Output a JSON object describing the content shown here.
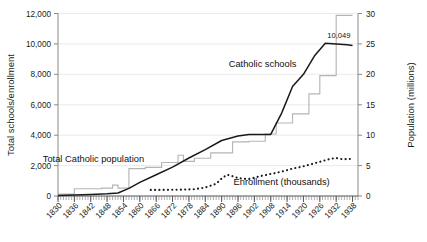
{
  "chart_data": {
    "type": "line",
    "title": "",
    "subtitle": "",
    "xlabel": "",
    "ylabel": "Total schools/enrollment",
    "y2label": "Population (millions)",
    "grid": true,
    "legend_position": "inline-annotations",
    "xlim": [
      1830,
      1940
    ],
    "ylim": [
      0,
      12000
    ],
    "y2lim": [
      0,
      30
    ],
    "x_tick_labels": [
      "1830",
      "1836",
      "1842",
      "1848",
      "1854",
      "1860",
      "1866",
      "1872",
      "1878",
      "1884",
      "1890",
      "1896",
      "1902",
      "1908",
      "1914",
      "1920",
      "1926",
      "1932",
      "1938"
    ],
    "x_tick_values": [
      1830,
      1836,
      1842,
      1848,
      1854,
      1860,
      1866,
      1872,
      1878,
      1884,
      1890,
      1896,
      1902,
      1908,
      1914,
      1920,
      1926,
      1932,
      1938
    ],
    "y_tick_labels": [
      "0",
      "2,000",
      "4,000",
      "6,000",
      "8,000",
      "10,000",
      "12,000"
    ],
    "y_tick_values": [
      0,
      2000,
      4000,
      6000,
      8000,
      10000,
      12000
    ],
    "y2_tick_labels": [
      "0",
      "5",
      "10",
      "15",
      "20",
      "25",
      "30"
    ],
    "y2_tick_values": [
      0,
      5,
      10,
      15,
      20,
      25,
      30
    ],
    "annotations": [
      {
        "name": "catholic-schools-label",
        "text": "Catholic schools",
        "x": 1905,
        "y": 8500,
        "axis": "left"
      },
      {
        "name": "total-catholic-population-label",
        "text": "Total Catholic population",
        "x": 1843,
        "y": 2250,
        "axis": "left"
      },
      {
        "name": "enrollment-label",
        "text": "Enrollment (thousands)",
        "x": 1912,
        "y": 700,
        "axis": "left"
      },
      {
        "name": "schools-endpoint-value-label",
        "text": "10,049",
        "x": 1933,
        "y": 10400,
        "axis": "left"
      }
    ],
    "series": [
      {
        "name": "Catholic schools",
        "axis": "left",
        "style": "solid-line",
        "color": "#1a1a1a",
        "unit": "schools",
        "x": [
          1830,
          1836,
          1842,
          1848,
          1852,
          1856,
          1860,
          1866,
          1872,
          1878,
          1884,
          1890,
          1896,
          1900,
          1904,
          1908,
          1912,
          1916,
          1920,
          1924,
          1928,
          1932,
          1936,
          1938
        ],
        "values": [
          35,
          60,
          100,
          150,
          200,
          500,
          900,
          1400,
          1900,
          2500,
          3050,
          3650,
          3950,
          4050,
          4050,
          4050,
          5450,
          7200,
          8000,
          9200,
          10049,
          10000,
          9950,
          9900
        ]
      },
      {
        "name": "Total Catholic population",
        "axis": "right",
        "style": "step-line",
        "color": "#b0b0b0",
        "unit": "millions",
        "x": [
          1830,
          1834,
          1836,
          1844,
          1846,
          1848,
          1850,
          1852,
          1854,
          1856,
          1858,
          1862,
          1864,
          1868,
          1870,
          1874,
          1876,
          1880,
          1882,
          1886,
          1890,
          1894,
          1896,
          1900,
          1902,
          1906,
          1908,
          1910,
          1912,
          1916,
          1918,
          1922,
          1926,
          1930,
          1932,
          1938
        ],
        "values": [
          0.3,
          0.3,
          1.2,
          1.2,
          1.3,
          1.3,
          1.8,
          1.3,
          1.3,
          4.5,
          4.5,
          4.7,
          4.7,
          5.5,
          5.5,
          6.7,
          5.7,
          6.2,
          6.2,
          7.1,
          7.1,
          8.9,
          8.9,
          9.0,
          9.0,
          10.2,
          10.2,
          12.0,
          12.0,
          13.5,
          13.5,
          16.8,
          19.8,
          19.8,
          29.7,
          29.7
        ]
      },
      {
        "name": "Enrollment (thousands)",
        "axis": "left",
        "style": "dotted-line",
        "color": "#1a1a1a",
        "unit": "thousands",
        "x": [
          1864,
          1868,
          1872,
          1876,
          1880,
          1884,
          1888,
          1890,
          1892,
          1894,
          1896,
          1898,
          1900,
          1902,
          1904,
          1908,
          1912,
          1916,
          1920,
          1924,
          1928,
          1930,
          1932,
          1934,
          1936,
          1938
        ],
        "values": [
          400,
          400,
          410,
          420,
          450,
          560,
          800,
          1150,
          1400,
          1300,
          1180,
          1130,
          1120,
          1200,
          1300,
          1450,
          1600,
          1800,
          1950,
          2150,
          2350,
          2450,
          2500,
          2430,
          2420,
          2450
        ]
      }
    ]
  }
}
